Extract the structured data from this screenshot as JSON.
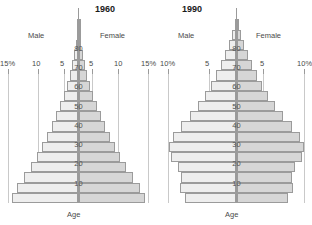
{
  "charts": [
    {
      "id": "chart-1960",
      "year": "1960",
      "male_label": "Male",
      "female_label": "Female",
      "age_caption": "Age",
      "axis_labels_left": [
        "15%",
        "10",
        "5"
      ],
      "axis_labels_right": [
        "5",
        "10",
        "15%"
      ],
      "age_ticks": [
        "10",
        "20",
        "30",
        "40",
        "50",
        "60",
        "70",
        "80"
      ]
    },
    {
      "id": "chart-1990",
      "year": "1990",
      "male_label": "Male",
      "female_label": "Female",
      "age_caption": "Age",
      "axis_labels_left": [
        "10%",
        "5"
      ],
      "axis_labels_right": [
        "5",
        "10%"
      ],
      "age_ticks": [
        "10",
        "20",
        "30",
        "40",
        "50",
        "60",
        "70",
        "80"
      ]
    }
  ],
  "colors": {
    "male_fill": "#eeeeee",
    "female_fill": "#d6d6d6",
    "bar_stroke": "#9b9b9b",
    "gridline": "#c9c9c9",
    "centerline": "#9a9a9a",
    "text": "#4a4a4a",
    "title": "#1a1a1a",
    "background": "#ffffff"
  },
  "chart_data": [
    {
      "type": "bar",
      "subtype": "population-pyramid",
      "title": "1960",
      "xlabel": "",
      "ylabel": "Age",
      "xlim": [
        -15,
        15
      ],
      "x_unit": "percent",
      "x_tick_values": [
        -15,
        -10,
        -5,
        0,
        5,
        10,
        15
      ],
      "x_tick_labels": [
        "15%",
        "10",
        "5",
        "",
        "5",
        "10",
        "15%"
      ],
      "grid": true,
      "legend": [
        "Male",
        "Female"
      ],
      "legend_position": "top",
      "age_groups": [
        "0-4",
        "5-9",
        "10-14",
        "15-19",
        "20-24",
        "25-29",
        "30-34",
        "35-39",
        "40-44",
        "45-49",
        "50-54",
        "55-59",
        "60-64",
        "65-69",
        "70-74",
        "75-79",
        "80-84",
        "85+"
      ],
      "age_axis_ticks": [
        10,
        20,
        30,
        40,
        50,
        60,
        70,
        80
      ],
      "series": [
        {
          "name": "Male",
          "side": "left",
          "values": [
            14.3,
            13.1,
            11.6,
            10.1,
            8.9,
            7.8,
            6.7,
            5.7,
            4.8,
            4.0,
            3.2,
            2.5,
            1.9,
            1.4,
            0.95,
            0.6,
            0.33,
            0.14
          ]
        },
        {
          "name": "Female",
          "side": "right",
          "values": [
            14.3,
            13.1,
            11.6,
            10.1,
            8.9,
            7.8,
            6.7,
            5.7,
            4.8,
            4.0,
            3.2,
            2.5,
            1.9,
            1.4,
            0.95,
            0.6,
            0.33,
            0.14
          ]
        }
      ]
    },
    {
      "type": "bar",
      "subtype": "population-pyramid",
      "title": "1990",
      "xlabel": "",
      "ylabel": "Age",
      "xlim": [
        -10,
        10
      ],
      "x_unit": "percent",
      "x_tick_values": [
        -10,
        -5,
        0,
        5,
        10
      ],
      "x_tick_labels": [
        "10%",
        "5",
        "",
        "5",
        "10%"
      ],
      "grid": true,
      "legend": [
        "Male",
        "Female"
      ],
      "legend_position": "top",
      "age_groups": [
        "0-4",
        "5-9",
        "10-14",
        "15-19",
        "20-24",
        "25-29",
        "30-34",
        "35-39",
        "40-44",
        "45-49",
        "50-54",
        "55-59",
        "60-64",
        "65-69",
        "70-74",
        "75-79",
        "80-84",
        "85+"
      ],
      "age_axis_ticks": [
        10,
        20,
        30,
        40,
        50,
        60,
        70,
        80
      ],
      "series": [
        {
          "name": "Male",
          "side": "left",
          "values": [
            7.6,
            8.3,
            8.1,
            8.6,
            9.6,
            9.9,
            9.3,
            8.2,
            6.9,
            5.7,
            4.7,
            3.8,
            3.0,
            2.3,
            1.65,
            1.1,
            0.62,
            0.26
          ]
        },
        {
          "name": "Female",
          "side": "right",
          "values": [
            7.6,
            8.3,
            8.1,
            8.6,
            9.6,
            9.9,
            9.3,
            8.2,
            6.9,
            5.7,
            4.7,
            3.8,
            3.0,
            2.3,
            1.65,
            1.1,
            0.62,
            0.26
          ]
        }
      ]
    }
  ]
}
